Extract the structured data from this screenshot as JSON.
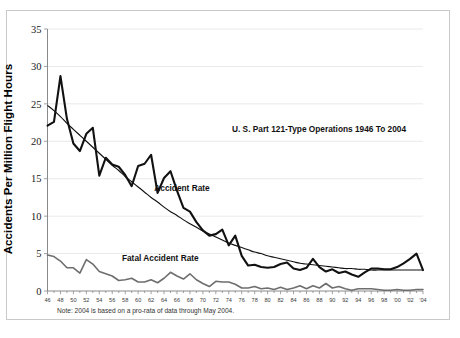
{
  "chart_data": {
    "type": "line",
    "title": "U. S. Part 121-Type Operations 1946 To 2004",
    "xlabel": "",
    "ylabel": "Accidents Per Million Flight Hours",
    "ylim": [
      0,
      35
    ],
    "ytick_step": 5,
    "yticks": [
      "0",
      "5",
      "10",
      "15",
      "20",
      "25",
      "30",
      "35"
    ],
    "xlim": [
      1946,
      2004
    ],
    "xtick_step": 2,
    "grid": "horizontal",
    "legend_position": "inline-annotations",
    "note": "Note: 2004 is based on a pro-rata of data through May 2004.",
    "xticklabels": [
      "46",
      "48",
      "50",
      "52",
      "54",
      "56",
      "58",
      "60",
      "62",
      "64",
      "66",
      "68",
      "70",
      "72",
      "74",
      "76",
      "78",
      "80",
      "82",
      "84",
      "86",
      "88",
      "90",
      "92",
      "94",
      "96",
      "98",
      "'00",
      "'02",
      "'04"
    ],
    "x": [
      1946,
      1947,
      1948,
      1949,
      1950,
      1951,
      1952,
      1953,
      1954,
      1955,
      1956,
      1957,
      1958,
      1959,
      1960,
      1961,
      1962,
      1963,
      1964,
      1965,
      1966,
      1967,
      1968,
      1969,
      1970,
      1971,
      1972,
      1973,
      1974,
      1975,
      1976,
      1977,
      1978,
      1979,
      1980,
      1981,
      1982,
      1983,
      1984,
      1985,
      1986,
      1987,
      1988,
      1989,
      1990,
      1991,
      1992,
      1993,
      1994,
      1995,
      1996,
      1997,
      1998,
      1999,
      2000,
      2001,
      2002,
      2003,
      2004
    ],
    "series": [
      {
        "name": "Accident Rate",
        "color": "#111111",
        "style": "thick-jagged",
        "values": [
          22.1,
          22.6,
          28.7,
          23.0,
          19.7,
          18.7,
          21.0,
          21.8,
          15.4,
          17.8,
          16.9,
          16.6,
          15.5,
          14.0,
          16.7,
          17.0,
          18.2,
          13.1,
          15.1,
          16.0,
          13.4,
          11.1,
          10.6,
          9.2,
          8.1,
          7.4,
          7.6,
          8.2,
          6.1,
          7.4,
          4.7,
          3.4,
          3.5,
          3.2,
          3.1,
          3.2,
          3.6,
          3.8,
          3.0,
          2.8,
          3.1,
          4.3,
          3.2,
          2.6,
          2.9,
          2.4,
          2.6,
          2.2,
          1.9,
          2.5,
          3.0,
          3.0,
          2.9,
          2.9,
          3.2,
          3.7,
          4.3,
          5.0,
          2.8
        ],
        "annotation": {
          "text": "Accident Rate",
          "x": 1962.5,
          "y": 13.3
        }
      },
      {
        "name": "Trend",
        "color": "#111111",
        "style": "thin-smooth",
        "values": [
          24.8,
          24.1,
          23.3,
          22.4,
          21.6,
          20.8,
          20.0,
          19.2,
          18.4,
          17.6,
          16.8,
          16.1,
          15.3,
          14.6,
          13.9,
          13.2,
          12.5,
          11.9,
          11.2,
          10.6,
          10.1,
          9.5,
          9.0,
          8.5,
          8.0,
          7.6,
          7.2,
          6.8,
          6.4,
          6.1,
          5.8,
          5.5,
          5.2,
          5.0,
          4.7,
          4.5,
          4.3,
          4.1,
          3.9,
          3.7,
          3.6,
          3.5,
          3.4,
          3.3,
          3.2,
          3.1,
          3.0,
          3.0,
          2.9,
          2.9,
          2.8,
          2.8,
          2.8,
          2.8,
          2.8,
          2.8,
          2.8,
          2.8,
          2.8
        ]
      },
      {
        "name": "Fatal Accident Rate",
        "color": "#6e6e6e",
        "style": "medium",
        "values": [
          4.8,
          4.6,
          4.0,
          3.1,
          3.1,
          2.4,
          4.2,
          3.6,
          2.6,
          2.3,
          2.0,
          1.4,
          1.5,
          1.7,
          1.2,
          1.2,
          1.5,
          1.1,
          1.7,
          2.5,
          2.0,
          1.6,
          2.3,
          1.5,
          1.0,
          0.6,
          1.3,
          1.2,
          1.2,
          0.9,
          0.4,
          0.4,
          0.6,
          0.3,
          0.4,
          0.2,
          0.5,
          0.2,
          0.4,
          0.7,
          0.3,
          0.7,
          0.4,
          1.0,
          0.4,
          0.6,
          0.3,
          0.1,
          0.3,
          0.3,
          0.3,
          0.2,
          0.1,
          0.1,
          0.2,
          0.1,
          0.1,
          0.2,
          0.2
        ],
        "annotation": {
          "text": "Fatal Accident Rate",
          "x": 1957.5,
          "y": 4.0
        }
      }
    ]
  },
  "annotations": {
    "chart_title": "U. S. Part 121-Type Operations 1946 To 2004",
    "accident_rate_label": "Accident Rate",
    "fatal_accident_rate_label": "Fatal Accident Rate",
    "footnote": "Note: 2004 is based on a pro-rata of data through May 2004.",
    "y_axis_title": "Accidents Per Million Flight Hours"
  }
}
